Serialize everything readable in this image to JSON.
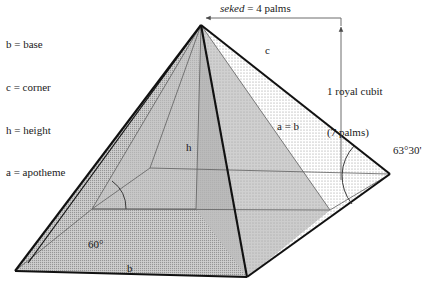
{
  "figure": {
    "type": "geometry-diagram",
    "legend": {
      "items": [
        {
          "symbol": "b",
          "meaning": "base",
          "text": "b = base"
        },
        {
          "symbol": "c",
          "meaning": "corner",
          "text": "c = corner"
        },
        {
          "symbol": "h",
          "meaning": "height",
          "text": "h = height"
        },
        {
          "symbol": "a",
          "meaning": "apotheme",
          "text": "a = apotheme"
        }
      ]
    },
    "annotations": {
      "seked_italic": "seked",
      "seked_rest": " = 4 palms",
      "cubit_line1": "1 royal cubit",
      "cubit_line2": "(7 palms)",
      "angle_right": "63°30'",
      "angle_left": "60°",
      "edge_corner": "c",
      "edge_apotheme_base": "a = b",
      "edge_height": "h",
      "edge_base": "b"
    },
    "colors": {
      "stroke": "#111111",
      "thin_stroke": "#555555",
      "face_left_gray": "#b8b8b8",
      "face_front_dark": "#9a9a9a",
      "face_right_light": "#e9e9e9",
      "base_dotted": "#f0f0f0",
      "background": "#ffffff",
      "arrow": "#6d6d6d"
    },
    "geometry": {
      "apex": [
        201,
        25
      ],
      "base_left": [
        15,
        271
      ],
      "base_front": [
        247,
        277
      ],
      "base_right": [
        390,
        174
      ],
      "base_back": [
        150,
        168
      ],
      "base_center": [
        196,
        209
      ]
    }
  }
}
